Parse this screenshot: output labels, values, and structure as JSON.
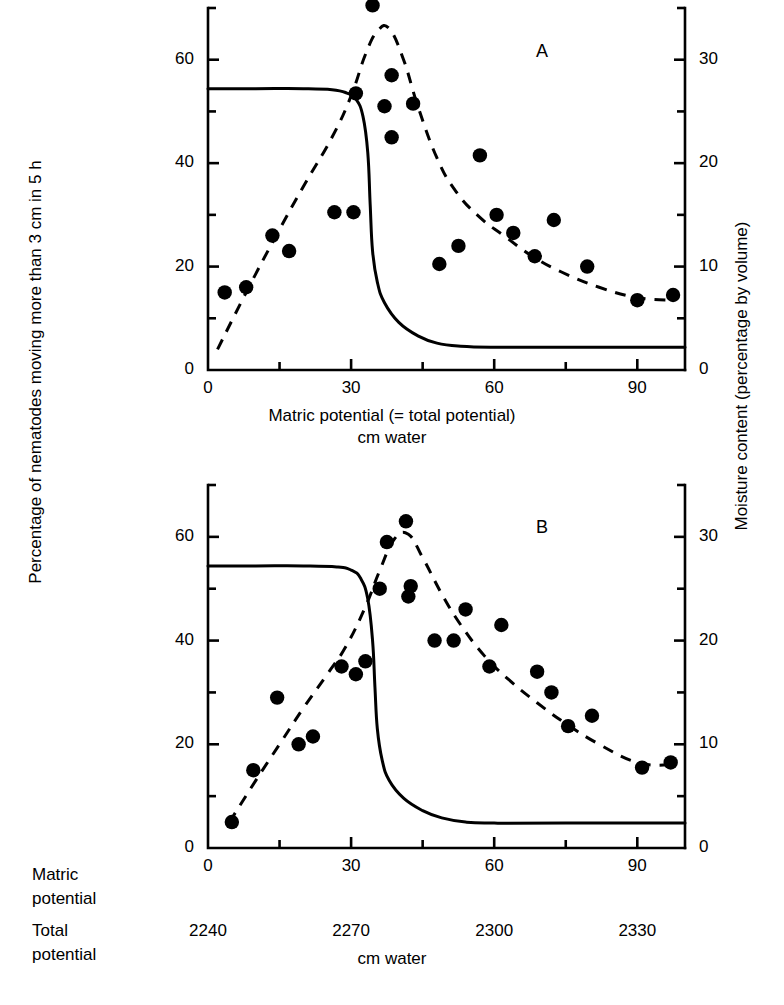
{
  "figure": {
    "axis_left_title": "Percentage of nematodes moving more than 3 cm in 5 h",
    "axis_right_title": "Moisture content (percentage by volume)",
    "xtitle_line1": "Matric potential (= total potential)",
    "xtitle_line2": "cm water",
    "bottom_xtitle": "cm water",
    "row_label_matric_line1": "Matric",
    "row_label_matric_line2": "potential",
    "row_label_total_line1": "Total",
    "row_label_total_line2": "potential",
    "panelA_letter": "A",
    "panelB_letter": "B",
    "ink_color": "#000000",
    "background_color": "#ffffff"
  },
  "chart_data": [
    {
      "type": "scatter",
      "id": "panel-A",
      "title": "A",
      "xlabel": "Matric potential (= total potential) cm water",
      "ylabel": "Percentage of nematodes moving more than 3 cm in 5 h",
      "y2label": "Moisture content (percentage by volume)",
      "xlim": [
        0,
        100
      ],
      "ylim": [
        0,
        70
      ],
      "y2lim": [
        0,
        35
      ],
      "grid": false,
      "legend": "none",
      "xticks_major": [
        0,
        30,
        60,
        90
      ],
      "xticks_minor": [
        15,
        45,
        75
      ],
      "xticklabels": [
        "0",
        "30",
        "60",
        "90"
      ],
      "yticks_major": [
        0,
        20,
        40,
        60
      ],
      "yticks_minor": [
        10,
        30,
        50,
        70
      ],
      "yticklabels": [
        "0",
        "20",
        "40",
        "60"
      ],
      "y2ticks_major": [
        0,
        10,
        20,
        30
      ],
      "y2ticks_minor": [
        5,
        15,
        25,
        35
      ],
      "y2ticklabels": [
        "0",
        "10",
        "20",
        "30"
      ],
      "series": [
        {
          "name": "Nematodes moving more than 3 cm in 5 h",
          "marker": "filled-circle",
          "axis": "left",
          "points": [
            [
              3.5,
              15.0
            ],
            [
              8.0,
              16.0
            ],
            [
              13.5,
              26.0
            ],
            [
              17.0,
              23.0
            ],
            [
              26.5,
              30.5
            ],
            [
              30.5,
              30.5
            ],
            [
              31.0,
              53.5
            ],
            [
              34.5,
              70.5
            ],
            [
              37.0,
              51.0
            ],
            [
              38.5,
              57.0
            ],
            [
              38.5,
              45.0
            ],
            [
              43.0,
              51.5
            ],
            [
              48.5,
              20.5
            ],
            [
              52.5,
              24.0
            ],
            [
              57.0,
              41.5
            ],
            [
              60.5,
              30.0
            ],
            [
              64.0,
              26.5
            ],
            [
              68.5,
              22.0
            ],
            [
              72.5,
              29.0
            ],
            [
              79.5,
              20.0
            ],
            [
              90.0,
              13.5
            ],
            [
              97.5,
              14.5
            ]
          ]
        },
        {
          "name": "Fitted nematode response (dashed)",
          "style": "dashed",
          "axis": "left",
          "points": [
            [
              2.0,
              4.0
            ],
            [
              8.0,
              15.0
            ],
            [
              14.0,
              25.5
            ],
            [
              20.0,
              35.5
            ],
            [
              26.0,
              45.0
            ],
            [
              30.0,
              53.0
            ],
            [
              33.0,
              61.0
            ],
            [
              35.5,
              65.5
            ],
            [
              38.0,
              66.0
            ],
            [
              41.0,
              60.0
            ],
            [
              44.0,
              51.0
            ],
            [
              48.0,
              41.0
            ],
            [
              52.0,
              34.5
            ],
            [
              57.0,
              29.5
            ],
            [
              62.0,
              26.0
            ],
            [
              68.0,
              22.0
            ],
            [
              74.0,
              19.0
            ],
            [
              82.0,
              16.0
            ],
            [
              90.0,
              14.0
            ],
            [
              97.5,
              13.5
            ]
          ]
        },
        {
          "name": "Moisture retention curve (solid)",
          "style": "solid",
          "axis": "right",
          "points": [
            [
              0.0,
              27.2
            ],
            [
              10.0,
              27.2
            ],
            [
              20.0,
              27.2
            ],
            [
              26.0,
              27.1
            ],
            [
              29.0,
              26.8
            ],
            [
              31.0,
              26.2
            ],
            [
              32.5,
              24.5
            ],
            [
              33.5,
              21.0
            ],
            [
              34.0,
              16.0
            ],
            [
              34.5,
              11.5
            ],
            [
              35.5,
              8.5
            ],
            [
              37.0,
              6.5
            ],
            [
              40.0,
              4.6
            ],
            [
              44.0,
              3.3
            ],
            [
              48.0,
              2.6
            ],
            [
              53.0,
              2.3
            ],
            [
              60.0,
              2.2
            ],
            [
              75.0,
              2.2
            ],
            [
              90.0,
              2.2
            ],
            [
              100.0,
              2.2
            ]
          ]
        }
      ]
    },
    {
      "type": "scatter",
      "id": "panel-B",
      "title": "B",
      "xlabel": "cm water",
      "ylabel": "Percentage of nematodes moving more than 3 cm in 5 h",
      "y2label": "Moisture content (percentage by volume)",
      "xlim": [
        0,
        100
      ],
      "ylim": [
        0,
        70
      ],
      "y2lim": [
        0,
        35
      ],
      "grid": false,
      "legend": "none",
      "xticks_major": [
        0,
        30,
        60,
        90
      ],
      "xticks_minor": [
        15,
        45,
        75
      ],
      "xticklabels": [
        "0",
        "30",
        "60",
        "90"
      ],
      "xticklabels_total_potential": [
        "2240",
        "2270",
        "2300",
        "2330"
      ],
      "yticks_major": [
        0,
        20,
        40,
        60
      ],
      "yticks_minor": [
        10,
        30,
        50,
        70
      ],
      "yticklabels": [
        "0",
        "20",
        "40",
        "60"
      ],
      "y2ticks_major": [
        0,
        10,
        20,
        30
      ],
      "y2ticks_minor": [
        5,
        15,
        25,
        35
      ],
      "y2ticklabels": [
        "0",
        "10",
        "20",
        "30"
      ],
      "series": [
        {
          "name": "Nematodes moving more than 3 cm in 5 h",
          "marker": "filled-circle",
          "axis": "left",
          "points": [
            [
              5.0,
              5.0
            ],
            [
              9.5,
              15.0
            ],
            [
              14.5,
              29.0
            ],
            [
              19.0,
              20.0
            ],
            [
              22.0,
              21.5
            ],
            [
              28.0,
              35.0
            ],
            [
              31.0,
              33.5
            ],
            [
              33.0,
              36.0
            ],
            [
              36.0,
              50.0
            ],
            [
              37.5,
              59.0
            ],
            [
              41.5,
              63.0
            ],
            [
              42.5,
              50.5
            ],
            [
              42.0,
              48.5
            ],
            [
              47.5,
              40.0
            ],
            [
              51.5,
              40.0
            ],
            [
              54.0,
              46.0
            ],
            [
              59.0,
              35.0
            ],
            [
              61.5,
              43.0
            ],
            [
              69.0,
              34.0
            ],
            [
              72.0,
              30.0
            ],
            [
              75.5,
              23.5
            ],
            [
              80.5,
              25.5
            ],
            [
              91.0,
              15.5
            ],
            [
              97.0,
              16.5
            ]
          ]
        },
        {
          "name": "Fitted nematode response (dashed)",
          "style": "dashed",
          "axis": "left",
          "points": [
            [
              4.5,
              5.0
            ],
            [
              10.0,
              13.0
            ],
            [
              15.0,
              20.0
            ],
            [
              20.0,
              27.0
            ],
            [
              25.0,
              33.5
            ],
            [
              29.0,
              39.0
            ],
            [
              33.0,
              46.5
            ],
            [
              36.0,
              53.5
            ],
            [
              39.0,
              59.5
            ],
            [
              42.0,
              60.5
            ],
            [
              45.0,
              56.0
            ],
            [
              49.0,
              49.0
            ],
            [
              53.0,
              43.0
            ],
            [
              58.0,
              37.0
            ],
            [
              63.0,
              32.5
            ],
            [
              69.0,
              28.0
            ],
            [
              75.0,
              24.0
            ],
            [
              82.0,
              20.0
            ],
            [
              90.0,
              16.5
            ],
            [
              97.0,
              16.0
            ]
          ]
        },
        {
          "name": "Moisture retention curve (solid)",
          "style": "solid",
          "axis": "right",
          "points": [
            [
              0.0,
              27.2
            ],
            [
              10.0,
              27.2
            ],
            [
              20.0,
              27.2
            ],
            [
              27.0,
              27.1
            ],
            [
              30.0,
              26.8
            ],
            [
              32.0,
              26.0
            ],
            [
              33.5,
              24.0
            ],
            [
              34.5,
              20.0
            ],
            [
              35.0,
              15.5
            ],
            [
              35.5,
              11.5
            ],
            [
              36.5,
              8.5
            ],
            [
              38.0,
              6.5
            ],
            [
              41.0,
              4.8
            ],
            [
              45.0,
              3.6
            ],
            [
              49.0,
              2.9
            ],
            [
              54.0,
              2.5
            ],
            [
              60.0,
              2.4
            ],
            [
              75.0,
              2.4
            ],
            [
              90.0,
              2.4
            ],
            [
              100.0,
              2.4
            ]
          ]
        }
      ]
    }
  ]
}
